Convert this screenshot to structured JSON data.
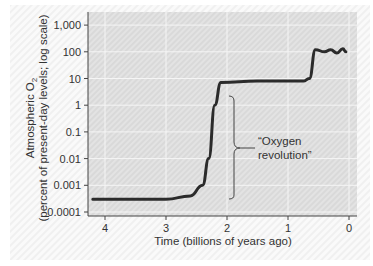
{
  "chart_data": {
    "type": "line",
    "title": "",
    "xlabel": "Time (billions of years ago)",
    "ylabel_line1": "Atmospheric O",
    "ylabel_sub": "2",
    "ylabel_line2": "(percent of present-day levels; log scale)",
    "y_scale": "log",
    "ylim": [
      0.0001,
      1000
    ],
    "xlim": [
      4.2,
      -0.1
    ],
    "x_ticks": [
      "4",
      "3",
      "2",
      "1",
      "0"
    ],
    "y_ticks": [
      "1,000",
      "100",
      "10",
      "1",
      "0.1",
      "0.01",
      "0.001",
      "0.0001"
    ],
    "grid": true,
    "series": [
      {
        "name": "Atmospheric O2",
        "x": [
          4.2,
          3.0,
          2.6,
          2.4,
          2.3,
          2.2,
          2.1,
          1.5,
          0.75,
          0.65,
          0.55,
          0.4,
          0.3,
          0.2,
          0.1,
          0.05
        ],
        "y": [
          0.0003,
          0.0003,
          0.0004,
          0.001,
          0.01,
          1,
          7,
          8,
          8,
          10,
          120,
          100,
          120,
          90,
          130,
          100
        ]
      }
    ],
    "annotations": [
      {
        "text_line1": "“Oxygen",
        "text_line2": "revolution”",
        "range_y": [
          0.0005,
          5
        ]
      }
    ]
  }
}
